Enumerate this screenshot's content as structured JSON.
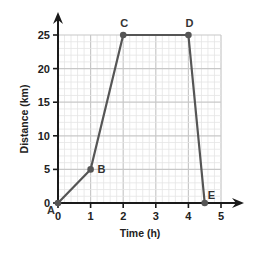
{
  "chart_data": {
    "type": "line",
    "title": "",
    "xlabel": "Time (h)",
    "ylabel": "Distance (km)",
    "xlim": [
      0,
      5
    ],
    "ylim": [
      0,
      25
    ],
    "x_ticks": [
      0,
      1,
      2,
      3,
      4,
      5
    ],
    "y_ticks": [
      0,
      5,
      10,
      15,
      20,
      25
    ],
    "grid": true,
    "minor_grid_per_major": 5,
    "legend": null,
    "series": [
      {
        "name": "journey",
        "points": [
          {
            "label": "A",
            "x": 0,
            "y": 0
          },
          {
            "label": "B",
            "x": 1,
            "y": 5
          },
          {
            "label": "C",
            "x": 2,
            "y": 25
          },
          {
            "label": "D",
            "x": 4,
            "y": 25
          },
          {
            "label": "E",
            "x": 4.5,
            "y": 0
          }
        ]
      }
    ]
  },
  "colors": {
    "line": "#555555",
    "axis": "#1a1a1a",
    "grid_major": "#c8c8c8",
    "grid_minor": "#e4e4e4"
  }
}
